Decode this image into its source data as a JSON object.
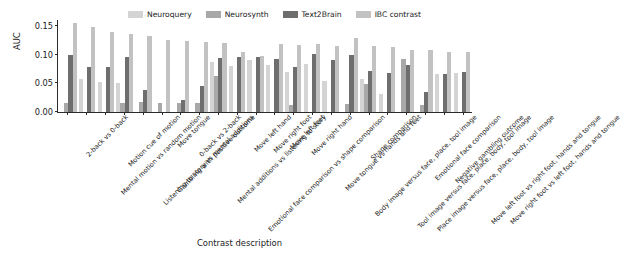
{
  "chart_data": {
    "type": "bar",
    "title": "",
    "xlabel": "Contrast description",
    "ylabel": "AUC",
    "ylim": [
      0.0,
      0.16
    ],
    "yticks": [
      "0.00",
      "0.05",
      "0.10",
      "0.15"
    ],
    "ytick_values": [
      0.0,
      0.05,
      0.1,
      0.15
    ],
    "grid": false,
    "legend_position": "top",
    "colors": {
      "neuroquery": "#d4d4d4",
      "neurosynth": "#a8a8a8",
      "text2brain": "#6e6e6e",
      "ibc_contrast": "#c2c2c2"
    },
    "categories": [
      "2-back vs 0-back",
      "Mental motion vs random motion",
      "Motion cue of motion",
      "Listening to story vs mental additions",
      "Gambling with positive outcome",
      "Move tongue",
      "0-back vs 2-back",
      "Mental additions vs listening to story",
      "Emotional face comparison vs shape comparison",
      "Move left hand",
      "Move right foot",
      "Move left foot",
      "Move right hand",
      "Move tongue vs hands and feet",
      "Body image versus face, place, tool image",
      "Shape comparison",
      "Tool image versus face, place, body, tool image",
      "Place image versus face, place, body, tool image",
      "Emotional face comparison",
      "Negative gambling outcome",
      "Move left foot vs right foot, hands and tongue",
      "Move right foot vs left foot, hands and tongue"
    ],
    "series": [
      {
        "name": "Neuroquery",
        "color": "#d4d4d4",
        "values": [
          0.0,
          0.058,
          0.053,
          0.051,
          0.0,
          0.0,
          0.0,
          0.0,
          0.087,
          0.08,
          0.09,
          0.081,
          0.069,
          0.084,
          0.054,
          0.0,
          0.057,
          0.031,
          0.0,
          0.0,
          0.066,
          0.068
        ]
      },
      {
        "name": "Neurosynth",
        "color": "#a8a8a8",
        "values": [
          0.015,
          0.0,
          0.0,
          0.015,
          0.018,
          0.015,
          0.016,
          0.015,
          0.063,
          0.0,
          0.0,
          0.0,
          0.013,
          0.0,
          0.0,
          0.014,
          0.049,
          0.0,
          0.093,
          0.013,
          0.0,
          0.0
        ]
      },
      {
        "name": "Text2Brain",
        "color": "#6e6e6e",
        "values": [
          0.099,
          0.078,
          0.078,
          0.096,
          0.038,
          0.0,
          0.021,
          0.045,
          0.094,
          0.096,
          0.095,
          0.092,
          0.079,
          0.101,
          0.091,
          0.1,
          0.071,
          0.067,
          0.081,
          0.035,
          0.066,
          0.07
        ]
      },
      {
        "name": "IBC contrast",
        "color": "#c2c2c2",
        "values": [
          0.155,
          0.148,
          0.14,
          0.136,
          0.132,
          0.125,
          0.123,
          0.121,
          0.12,
          0.105,
          0.097,
          0.118,
          0.116,
          0.119,
          0.115,
          0.129,
          0.115,
          0.113,
          0.108,
          0.107,
          0.104,
          0.104
        ]
      }
    ],
    "legend_entries": [
      {
        "label": "Neuroquery",
        "color": "#d4d4d4"
      },
      {
        "label": "Neurosynth",
        "color": "#a8a8a8"
      },
      {
        "label": "Text2Brain",
        "color": "#6e6e6e"
      },
      {
        "label": "IBC contrast",
        "color": "#c2c2c2"
      }
    ]
  }
}
